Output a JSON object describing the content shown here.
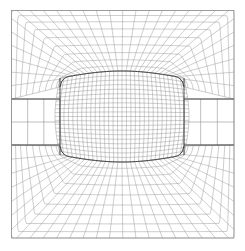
{
  "figure": {
    "type": "mesh-plot",
    "background_color": "#ffffff",
    "line_color": "#9a9a9a",
    "block_edge_color": "#3a3a3a",
    "border_color": "#888888",
    "width": 245,
    "height": 251
  },
  "chart_data": {
    "type": "mesh",
    "xlabel": "",
    "ylabel": "",
    "grid": true,
    "legend": "none",
    "domain": {
      "x0": 11.5,
      "y0": 10.5,
      "x1": 234.0,
      "y1": 238.0
    },
    "body": {
      "label": "inner rectangular body",
      "x0": 60.0,
      "y0": 78.0,
      "x1": 184.0,
      "y1": 155.0,
      "corner_radius": 9.0
    },
    "blocks": [
      {
        "name": "core",
        "region": "interior-of-body",
        "nx": 30,
        "ny": 20,
        "bulge_top": 7.0,
        "bulge_bottom": 7.0,
        "bulge_left": 5.0,
        "bulge_right": 5.0
      },
      {
        "name": "north",
        "region": "above-body",
        "nx": 30,
        "ny": 9,
        "radial": true
      },
      {
        "name": "south",
        "region": "below-body",
        "nx": 30,
        "ny": 9,
        "radial": true
      },
      {
        "name": "west",
        "region": "left-band",
        "nx": 3,
        "ny": 3,
        "radial": false
      },
      {
        "name": "east",
        "region": "right-band",
        "nx": 3,
        "ny": 3,
        "radial": false
      }
    ],
    "bands": {
      "left": {
        "x0": 11.5,
        "x1": 60.0,
        "y0": 99.0,
        "y1": 145.0,
        "rows": [
          99.0,
          122.0,
          145.0
        ]
      },
      "right": {
        "x0": 184.0,
        "x1": 234.0,
        "y0": 99.0,
        "y1": 145.0,
        "rows": [
          99.0,
          122.0,
          145.0
        ]
      }
    }
  }
}
